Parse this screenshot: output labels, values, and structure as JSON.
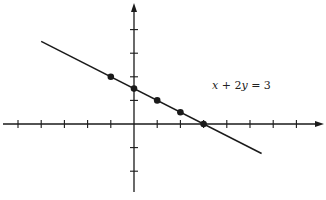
{
  "chart_data": {
    "type": "line",
    "title": "",
    "equation": "x + 2y = 3",
    "xlabel": "",
    "ylabel": "",
    "xlim": [
      -6,
      8
    ],
    "ylim": [
      -3,
      4
    ],
    "x_ticks": [
      -5,
      -4,
      -3,
      -2,
      -1,
      1,
      2,
      3,
      4,
      5,
      6,
      7
    ],
    "y_ticks": [
      -2,
      -1,
      1,
      2,
      3,
      4
    ],
    "grid": false,
    "tick_labels_shown": false,
    "series": [
      {
        "name": "x + 2y = 3",
        "kind": "line",
        "x": [
          -4,
          5.5
        ],
        "y": [
          3.5,
          -1.25
        ]
      },
      {
        "name": "plotted points",
        "kind": "scatter",
        "points": [
          {
            "x": -1,
            "y": 2
          },
          {
            "x": 0,
            "y": 1.5
          },
          {
            "x": 1,
            "y": 1
          },
          {
            "x": 2,
            "y": 0.5
          },
          {
            "x": 3,
            "y": 0
          }
        ]
      }
    ],
    "annotations": [
      {
        "text": "x + 2y = 3",
        "x": 4,
        "y": 1.5
      }
    ]
  },
  "labels": {
    "equation_lhs_x": "x",
    "equation_plus": " + 2",
    "equation_y": "y",
    "equation_rhs": " = 3"
  },
  "colors": {
    "ink": "#1a1a1a",
    "background": "#ffffff"
  }
}
